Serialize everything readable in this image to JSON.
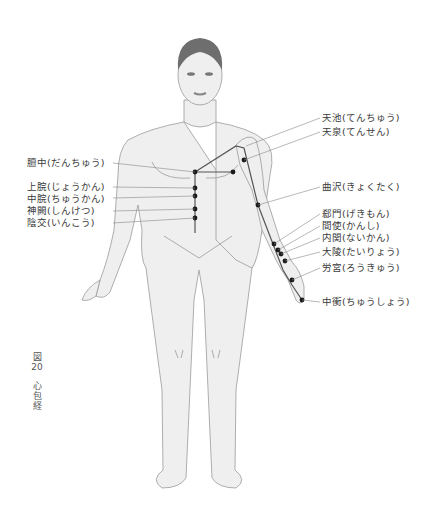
{
  "figure": {
    "number_label": "図",
    "number": "20",
    "title": "心包経"
  },
  "points_right": [
    {
      "name": "天池(てんちゅう)"
    },
    {
      "name": "天泉(てんせん)"
    },
    {
      "name": "曲沢(きょくたく)"
    },
    {
      "name": "郄門(げきもん)"
    },
    {
      "name": "間使(かんし)"
    },
    {
      "name": "内関(ないかん)"
    },
    {
      "name": "大陵(たいりょう)"
    },
    {
      "name": "労宮(ろうきゅう)"
    },
    {
      "name": "中衝(ちゅうしょう)"
    }
  ],
  "points_left": [
    {
      "name": "膻中(だんちゅう)"
    },
    {
      "name": "上脘(じょうかん)"
    },
    {
      "name": "中脘(ちゅうかん)"
    },
    {
      "name": "神闕(しんけつ)"
    },
    {
      "name": "陰交(いんこう)"
    }
  ],
  "colors": {
    "skin": "#efefef",
    "outline": "#9a9a9a",
    "hair": "#6e6e6e",
    "meridian": "#555555",
    "point": "#1a1a1a",
    "leader": "#888888"
  }
}
